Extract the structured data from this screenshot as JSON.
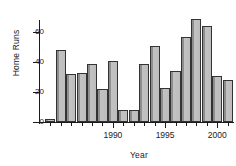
{
  "chart_data": {
    "type": "bar",
    "title": "",
    "xlabel": "Year",
    "ylabel": "Home Runs",
    "categories": [
      1984,
      1985,
      1986,
      1987,
      1988,
      1989,
      1990,
      1991,
      1992,
      1993,
      1994,
      1995,
      1996,
      1997,
      1998,
      1999,
      2000,
      2001
    ],
    "values": [
      2,
      48,
      32,
      33,
      39,
      22,
      41,
      8,
      8,
      39,
      51,
      23,
      34,
      57,
      69,
      64,
      31,
      28
    ],
    "xlim": [
      1983.4,
      2001.6
    ],
    "ylim": [
      0,
      72
    ],
    "yticks": [
      0,
      20,
      40,
      60
    ],
    "ytick_labels": [
      "0",
      "20",
      "40",
      "60"
    ],
    "xticks": [
      1990,
      1995,
      2000
    ],
    "xtick_labels": [
      "1990",
      "1995",
      "2000"
    ],
    "grid": false,
    "legend": null,
    "bar_fill": "#bdbdbd",
    "bar_edge": "#333333",
    "axis_color": "#1a1a1a",
    "background": "#ffffff"
  }
}
